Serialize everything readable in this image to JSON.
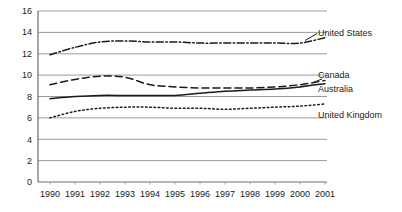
{
  "chart_data": {
    "type": "line",
    "title": "",
    "subtitle": "",
    "xlabel": "",
    "ylabel": "",
    "grid": true,
    "grid_axis": "y",
    "legend_position": "right-inline-labels",
    "categories": [
      "1990",
      "1991",
      "1992",
      "1993",
      "1994",
      "1995",
      "1996",
      "1997",
      "1998",
      "1999",
      "2000",
      "2001"
    ],
    "x": [
      1990,
      1991,
      1992,
      1993,
      1994,
      1995,
      1996,
      1997,
      1998,
      1999,
      2000,
      2001
    ],
    "xlim": [
      1990,
      2001
    ],
    "ylim": [
      0,
      16
    ],
    "yticks": [
      "0",
      "2",
      "4",
      "6",
      "8",
      "10",
      "12",
      "14",
      "16"
    ],
    "ytick_values": [
      0,
      2,
      4,
      6,
      8,
      10,
      12,
      14,
      16
    ],
    "series": [
      {
        "name": "United States",
        "style": "dash-dot",
        "color": "#1a1a1a",
        "values": [
          11.9,
          12.6,
          13.1,
          13.2,
          13.1,
          13.1,
          13.0,
          13.0,
          13.0,
          13.0,
          13.0,
          13.5
        ]
      },
      {
        "name": "Canada",
        "style": "dashed",
        "color": "#1a1a1a",
        "values": [
          9.1,
          9.6,
          9.9,
          9.8,
          9.1,
          8.9,
          8.8,
          8.8,
          8.8,
          8.9,
          9.1,
          9.5
        ]
      },
      {
        "name": "Australia",
        "style": "solid",
        "color": "#1a1a1a",
        "values": [
          7.8,
          8.0,
          8.1,
          8.1,
          8.1,
          8.1,
          8.3,
          8.5,
          8.6,
          8.7,
          8.9,
          9.2
        ]
      },
      {
        "name": "United Kingdom",
        "style": "dotted",
        "color": "#1a1a1a",
        "values": [
          6.0,
          6.6,
          6.9,
          7.0,
          7.0,
          6.9,
          6.9,
          6.8,
          6.9,
          7.0,
          7.1,
          7.3
        ]
      }
    ]
  },
  "axis": {
    "y_ticks": [
      "16",
      "14",
      "12",
      "10",
      "8",
      "6",
      "4",
      "2",
      "0"
    ],
    "x_ticks": [
      "1990",
      "1991",
      "1992",
      "1993",
      "1994",
      "1995",
      "1996",
      "1997",
      "1998",
      "1999",
      "2000",
      "2001"
    ]
  },
  "labels": {
    "united_states": "United States",
    "canada": "Canada",
    "australia": "Australia",
    "united_kingdom": "United Kingdom"
  },
  "colors": {
    "line": "#1a1a1a",
    "grid": "#9a9a9a",
    "axis": "#6e6e6e",
    "text": "#1a1a1a",
    "background": "#ffffff"
  }
}
